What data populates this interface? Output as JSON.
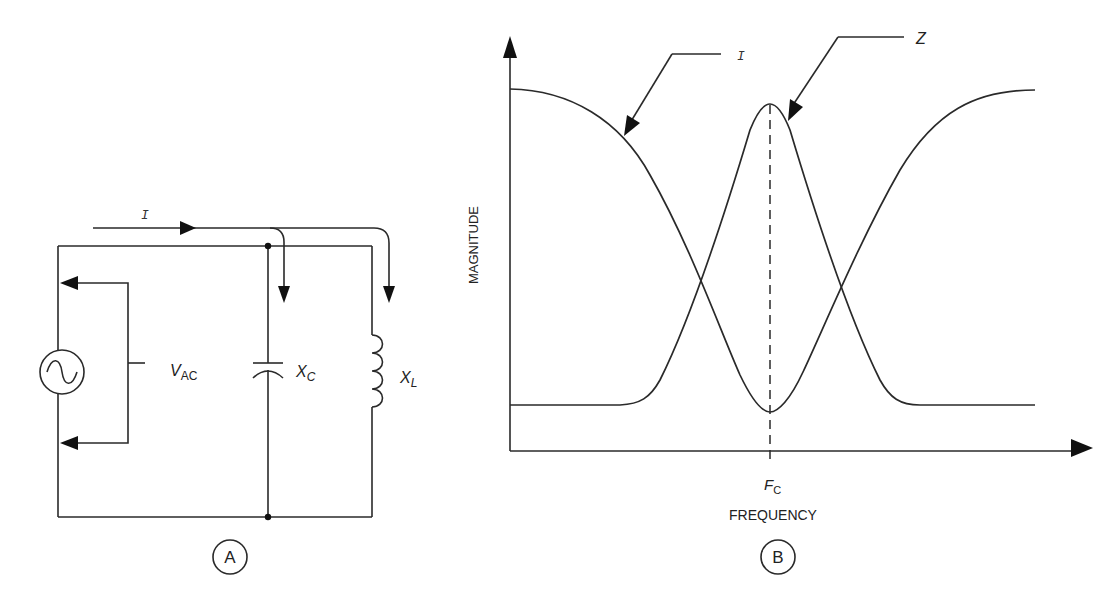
{
  "panel_a": {
    "label": "A",
    "current_label": "I",
    "source_label_main": "V",
    "source_label_sub": "AC",
    "capacitor_label_main": "X",
    "capacitor_label_sub": "C",
    "inductor_label_main": "X",
    "inductor_label_sub": "L"
  },
  "panel_b": {
    "label": "B",
    "y_axis_label": "MAGNITUDE",
    "x_axis_label": "FREQUENCY",
    "center_freq_main": "F",
    "center_freq_sub": "C",
    "curve_labels": {
      "current": "I",
      "impedance": "Z"
    }
  },
  "colors": {
    "line": "#2a2a2a",
    "background": "#ffffff"
  }
}
